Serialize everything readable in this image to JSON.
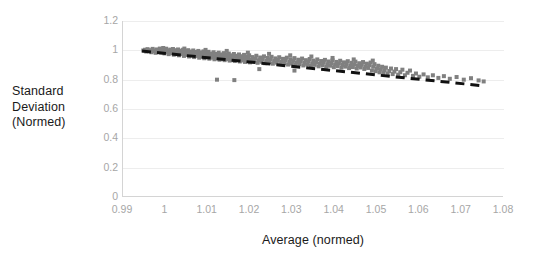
{
  "chart_data": {
    "type": "scatter",
    "title": "",
    "xlabel": "Average (normed)",
    "ylabel_lines": [
      "Standard",
      "Deviation",
      "(Normed)"
    ],
    "ylabel": "Standard Deviation (Normed)",
    "xlim": [
      0.99,
      1.08
    ],
    "ylim": [
      0,
      1.2
    ],
    "xticks": [
      "0.99",
      "1",
      "1.01",
      "1.02",
      "1.03",
      "1.04",
      "1.05",
      "1.06",
      "1.07",
      "1.08"
    ],
    "xtick_values": [
      0.99,
      1.0,
      1.01,
      1.02,
      1.03,
      1.04,
      1.05,
      1.06,
      1.07,
      1.08
    ],
    "yticks": [
      "0",
      "0.2",
      "0.4",
      "0.6",
      "0.8",
      "1",
      "1.2"
    ],
    "ytick_values": [
      0,
      0.2,
      0.4,
      0.6,
      0.8,
      1.0,
      1.2
    ],
    "grid": "horizontal",
    "legend": "none",
    "marker_color": "#808080",
    "marker_shape": "square",
    "marker_size_px": 4,
    "trendline": {
      "style": "dashed",
      "color": "#111111",
      "width_px": 3,
      "x_start": 0.9945,
      "y_start": 0.995,
      "x_end": 1.0755,
      "y_end": 0.757
    },
    "series": [
      {
        "name": "samples",
        "points": [
          [
            0.9948,
            0.999
          ],
          [
            0.9952,
            1.004
          ],
          [
            0.9955,
            0.992
          ],
          [
            0.9958,
            1.008
          ],
          [
            0.9961,
            0.996
          ],
          [
            0.9964,
            1.001
          ],
          [
            0.9967,
            0.987
          ],
          [
            0.997,
            1.01
          ],
          [
            0.9972,
            0.994
          ],
          [
            0.9975,
            1.0
          ],
          [
            0.9977,
            0.983
          ],
          [
            0.998,
            1.006
          ],
          [
            0.9982,
            0.991
          ],
          [
            0.9985,
            0.998
          ],
          [
            0.9987,
            1.012
          ],
          [
            0.999,
            0.985
          ],
          [
            0.9992,
            1.002
          ],
          [
            0.9994,
            0.993
          ],
          [
            0.9996,
            1.007
          ],
          [
            0.9998,
            0.979
          ],
          [
            1.0,
            0.996
          ],
          [
            1.0002,
            1.011
          ],
          [
            1.0004,
            0.988
          ],
          [
            1.0006,
            1.0
          ],
          [
            1.0008,
            0.974
          ],
          [
            1.001,
            0.992
          ],
          [
            1.0012,
            1.005
          ],
          [
            1.0014,
            0.982
          ],
          [
            1.0016,
            0.997
          ],
          [
            1.0018,
            1.009
          ],
          [
            1.002,
            0.97
          ],
          [
            1.0022,
            0.989
          ],
          [
            1.0024,
            1.001
          ],
          [
            1.0026,
            0.978
          ],
          [
            1.0028,
            0.994
          ],
          [
            1.003,
            1.006
          ],
          [
            1.0032,
            0.966
          ],
          [
            1.0034,
            0.985
          ],
          [
            1.0036,
            0.998
          ],
          [
            1.0038,
            0.974
          ],
          [
            1.004,
            0.991
          ],
          [
            1.0042,
            1.004
          ],
          [
            1.0044,
            0.962
          ],
          [
            1.0046,
            0.981
          ],
          [
            1.0048,
            0.995
          ],
          [
            1.005,
            0.97
          ],
          [
            1.0052,
            0.987
          ],
          [
            1.0054,
            1.001
          ],
          [
            1.0056,
            0.958
          ],
          [
            1.0058,
            0.977
          ],
          [
            1.006,
            0.992
          ],
          [
            1.0062,
            0.966
          ],
          [
            1.0064,
            0.983
          ],
          [
            1.0066,
            0.999
          ],
          [
            1.0068,
            0.954
          ],
          [
            1.007,
            0.973
          ],
          [
            1.0072,
            0.989
          ],
          [
            1.0074,
            0.962
          ],
          [
            1.0076,
            0.979
          ],
          [
            1.0078,
            0.996
          ],
          [
            1.008,
            0.95
          ],
          [
            1.0082,
            0.969
          ],
          [
            1.0084,
            0.986
          ],
          [
            1.0086,
            0.958
          ],
          [
            1.0088,
            0.975
          ],
          [
            1.009,
            0.993
          ],
          [
            1.0092,
            0.946
          ],
          [
            1.0094,
            0.965
          ],
          [
            1.0096,
            0.982
          ],
          [
            1.0098,
            0.954
          ],
          [
            1.01,
            0.971
          ],
          [
            1.0102,
            0.99
          ],
          [
            1.0104,
            0.943
          ],
          [
            1.0106,
            0.961
          ],
          [
            1.0108,
            0.978
          ],
          [
            1.011,
            0.95
          ],
          [
            1.0112,
            0.968
          ],
          [
            1.0114,
            0.987
          ],
          [
            1.0116,
            0.939
          ],
          [
            1.0118,
            0.957
          ],
          [
            1.012,
            0.975
          ],
          [
            1.0122,
            0.946
          ],
          [
            1.0124,
            0.964
          ],
          [
            1.0126,
            0.984
          ],
          [
            1.0128,
            0.936
          ],
          [
            1.013,
            0.954
          ],
          [
            1.0132,
            0.972
          ],
          [
            1.0134,
            0.943
          ],
          [
            1.0136,
            0.961
          ],
          [
            1.0138,
            0.981
          ],
          [
            1.014,
            0.933
          ],
          [
            1.0142,
            0.951
          ],
          [
            1.0144,
            0.969
          ],
          [
            1.0146,
            0.94
          ],
          [
            1.0148,
            0.958
          ],
          [
            1.015,
            0.978
          ],
          [
            1.0152,
            0.93
          ],
          [
            1.0154,
            0.948
          ],
          [
            1.0156,
            0.966
          ],
          [
            1.0158,
            0.937
          ],
          [
            1.016,
            0.955
          ],
          [
            1.0162,
            0.975
          ],
          [
            1.0164,
            0.927
          ],
          [
            1.0166,
            0.945
          ],
          [
            1.0168,
            0.963
          ],
          [
            1.017,
            0.934
          ],
          [
            1.0172,
            0.952
          ],
          [
            1.0174,
            0.972
          ],
          [
            1.0176,
            0.924
          ],
          [
            1.0178,
            0.942
          ],
          [
            1.018,
            0.96
          ],
          [
            1.0182,
            0.931
          ],
          [
            1.0184,
            0.949
          ],
          [
            1.0186,
            0.969
          ],
          [
            1.0188,
            0.921
          ],
          [
            1.019,
            0.939
          ],
          [
            1.0192,
            0.957
          ],
          [
            1.0194,
            0.928
          ],
          [
            1.0196,
            0.946
          ],
          [
            1.0198,
            0.966
          ],
          [
            1.02,
            0.918
          ],
          [
            1.0203,
            0.936
          ],
          [
            1.0206,
            0.954
          ],
          [
            1.0209,
            0.925
          ],
          [
            1.0212,
            0.943
          ],
          [
            1.0215,
            0.963
          ],
          [
            1.0218,
            0.915
          ],
          [
            1.0221,
            0.933
          ],
          [
            1.0224,
            0.951
          ],
          [
            1.0227,
            0.922
          ],
          [
            1.023,
            0.94
          ],
          [
            1.0233,
            0.959
          ],
          [
            1.0236,
            0.912
          ],
          [
            1.0239,
            0.93
          ],
          [
            1.0242,
            0.948
          ],
          [
            1.0245,
            0.919
          ],
          [
            1.0248,
            0.937
          ],
          [
            1.0251,
            0.956
          ],
          [
            1.0254,
            0.909
          ],
          [
            1.0257,
            0.927
          ],
          [
            1.026,
            0.945
          ],
          [
            1.0263,
            0.916
          ],
          [
            1.0266,
            0.934
          ],
          [
            1.0269,
            0.953
          ],
          [
            1.0272,
            0.906
          ],
          [
            1.0275,
            0.924
          ],
          [
            1.0278,
            0.942
          ],
          [
            1.0281,
            0.913
          ],
          [
            1.0284,
            0.931
          ],
          [
            1.0287,
            0.95
          ],
          [
            1.029,
            0.903
          ],
          [
            1.0293,
            0.921
          ],
          [
            1.0296,
            0.939
          ],
          [
            1.0299,
            0.91
          ],
          [
            1.0302,
            0.928
          ],
          [
            1.0305,
            0.947
          ],
          [
            1.0308,
            0.9
          ],
          [
            1.0311,
            0.918
          ],
          [
            1.0314,
            0.936
          ],
          [
            1.0317,
            0.907
          ],
          [
            1.032,
            0.925
          ],
          [
            1.0323,
            0.944
          ],
          [
            1.0326,
            0.897
          ],
          [
            1.0329,
            0.915
          ],
          [
            1.0332,
            0.933
          ],
          [
            1.0335,
            0.904
          ],
          [
            1.0338,
            0.922
          ],
          [
            1.0341,
            0.941
          ],
          [
            1.0344,
            0.894
          ],
          [
            1.0347,
            0.912
          ],
          [
            1.035,
            0.93
          ],
          [
            1.0353,
            0.901
          ],
          [
            1.0356,
            0.919
          ],
          [
            1.0359,
            0.938
          ],
          [
            1.0362,
            0.891
          ],
          [
            1.0365,
            0.909
          ],
          [
            1.0368,
            0.927
          ],
          [
            1.0371,
            0.898
          ],
          [
            1.0374,
            0.916
          ],
          [
            1.0377,
            0.935
          ],
          [
            1.038,
            0.888
          ],
          [
            1.0383,
            0.906
          ],
          [
            1.0386,
            0.924
          ],
          [
            1.0389,
            0.895
          ],
          [
            1.0392,
            0.913
          ],
          [
            1.0395,
            0.932
          ],
          [
            1.0398,
            0.885
          ],
          [
            1.0401,
            0.903
          ],
          [
            1.0404,
            0.921
          ],
          [
            1.0407,
            0.892
          ],
          [
            1.041,
            0.91
          ],
          [
            1.0413,
            0.929
          ],
          [
            1.0416,
            0.882
          ],
          [
            1.0419,
            0.9
          ],
          [
            1.0422,
            0.918
          ],
          [
            1.0425,
            0.889
          ],
          [
            1.0428,
            0.907
          ],
          [
            1.0431,
            0.926
          ],
          [
            1.0434,
            0.879
          ],
          [
            1.0437,
            0.897
          ],
          [
            1.044,
            0.915
          ],
          [
            1.0443,
            0.886
          ],
          [
            1.0446,
            0.904
          ],
          [
            1.0449,
            0.923
          ],
          [
            1.0452,
            0.876
          ],
          [
            1.0455,
            0.894
          ],
          [
            1.0458,
            0.912
          ],
          [
            1.0461,
            0.883
          ],
          [
            1.0464,
            0.901
          ],
          [
            1.0467,
            0.92
          ],
          [
            1.047,
            0.873
          ],
          [
            1.0473,
            0.891
          ],
          [
            1.0476,
            0.909
          ],
          [
            1.0479,
            0.88
          ],
          [
            1.0482,
            0.898
          ],
          [
            1.0485,
            0.917
          ],
          [
            1.0488,
            0.862
          ],
          [
            1.0491,
            0.888
          ],
          [
            1.0494,
            0.906
          ],
          [
            1.0497,
            0.858
          ],
          [
            1.05,
            0.877
          ],
          [
            1.0503,
            0.895
          ],
          [
            1.0506,
            0.85
          ],
          [
            1.0509,
            0.87
          ],
          [
            1.0512,
            0.888
          ],
          [
            1.0515,
            0.845
          ],
          [
            1.0518,
            0.864
          ],
          [
            1.0521,
            0.882
          ],
          [
            1.0525,
            0.841
          ],
          [
            1.0529,
            0.859
          ],
          [
            1.0533,
            0.876
          ],
          [
            1.0537,
            0.838
          ],
          [
            1.0541,
            0.855
          ],
          [
            1.0545,
            0.872
          ],
          [
            1.055,
            0.834
          ],
          [
            1.0555,
            0.851
          ],
          [
            1.056,
            0.868
          ],
          [
            1.0566,
            0.83
          ],
          [
            1.0572,
            0.847
          ],
          [
            1.0578,
            0.862
          ],
          [
            1.0585,
            0.826
          ],
          [
            1.0592,
            0.842
          ],
          [
            1.06,
            0.82
          ],
          [
            1.061,
            0.836
          ],
          [
            1.062,
            0.816
          ],
          [
            1.0632,
            0.83
          ],
          [
            1.0645,
            0.812
          ],
          [
            1.0658,
            0.824
          ],
          [
            1.0672,
            0.806
          ],
          [
            1.0688,
            0.818
          ],
          [
            1.0705,
            0.8
          ],
          [
            1.0722,
            0.81
          ],
          [
            1.074,
            0.795
          ],
          [
            1.0752,
            0.788
          ],
          [
            1.0122,
            0.8
          ],
          [
            1.0163,
            0.797
          ],
          [
            1.0305,
            0.862
          ],
          [
            1.0222,
            0.872
          ],
          [
            0.9995,
            1.016
          ],
          [
            1.0045,
            1.012
          ],
          [
            1.0095,
            1.003
          ],
          [
            1.0145,
            0.996
          ],
          [
            1.0195,
            0.984
          ],
          [
            1.0245,
            0.976
          ],
          [
            1.0295,
            0.966
          ],
          [
            1.0345,
            0.958
          ],
          [
            1.0395,
            0.948
          ],
          [
            1.0445,
            0.938
          ],
          [
            1.049,
            0.93
          ]
        ]
      }
    ]
  },
  "axis_titles": {
    "x": "Average (normed)",
    "y_line1": "Standard",
    "y_line2": "Deviation",
    "y_line3": "(Normed)"
  }
}
